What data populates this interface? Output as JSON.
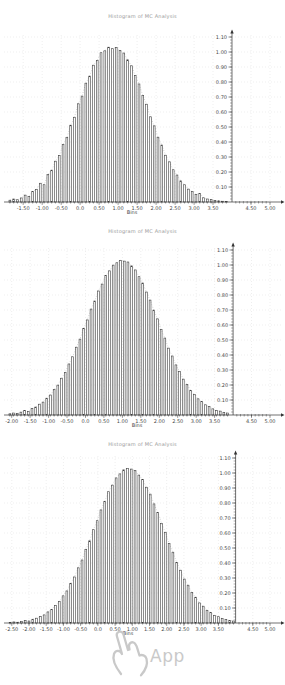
{
  "style": {
    "background_color": "#ffffff",
    "bar_color": "#3f3f3f",
    "axis_color": "#333333",
    "grid_color": "#dcdcdc",
    "envelope_color": "#b5b5b5",
    "label_color": "#4a4a4a",
    "title_color": "#9b9b9b",
    "watermark_color": "#c9c9c9"
  },
  "watermark": {
    "icon": "pointing-hand-icon",
    "label": "App"
  },
  "chart_data": [
    {
      "type": "bar",
      "title": "Histogram of MC Analysis",
      "xlabel": "Bins",
      "ylabel": "",
      "grid": "dotted",
      "xlim": [
        -1.9,
        5.0
      ],
      "ylim": [
        0,
        1.15
      ],
      "y_axis_x": 4.0,
      "bin_start": -1.85,
      "bin_step": 0.1,
      "values": [
        0.012,
        0.02,
        0.015,
        0.027,
        0.046,
        0.038,
        0.071,
        0.084,
        0.125,
        0.115,
        0.183,
        0.212,
        0.272,
        0.309,
        0.383,
        0.43,
        0.512,
        0.565,
        0.655,
        0.706,
        0.792,
        0.839,
        0.912,
        0.944,
        0.995,
        1.008,
        1.032,
        1.022,
        1.031,
        1.009,
        0.993,
        0.948,
        0.908,
        0.843,
        0.787,
        0.71,
        0.652,
        0.568,
        0.508,
        0.432,
        0.38,
        0.312,
        0.268,
        0.215,
        0.18,
        0.141,
        0.115,
        0.086,
        0.069,
        0.05,
        0.058,
        0.028,
        0.02,
        0.016,
        0.01,
        0.008,
        0.005,
        0.004
      ],
      "x_ticks": {
        "values": [
          -1.5,
          -1.0,
          -0.5,
          0,
          0.5,
          1.0,
          1.5,
          2.0,
          2.5,
          3.0,
          3.5,
          4.5,
          5.0
        ],
        "labels": [
          "-1.50",
          "-1.00",
          "-0.50",
          "0.0",
          "0.50",
          "1.00",
          "1.50",
          "2.00",
          "2.50",
          "3.00",
          "3.50",
          "4.50",
          "5.00"
        ]
      },
      "y_ticks": {
        "values": [
          0.1,
          0.2,
          0.3,
          0.4,
          0.5,
          0.6,
          0.7,
          0.8,
          0.9,
          1.0,
          1.1
        ],
        "labels": [
          "0.10",
          "0.20",
          "0.30",
          "0.40",
          "0.50",
          "0.60",
          "0.70",
          "0.80",
          "0.90",
          "1.00",
          "1.10"
        ]
      }
    },
    {
      "type": "bar",
      "title": "Histogram of MC Analysis",
      "xlabel": "Bins",
      "ylabel": "",
      "grid": "dotted",
      "xlim": [
        -2.1,
        5.0
      ],
      "ylim": [
        0,
        1.15
      ],
      "y_axis_x": 4.0,
      "bin_start": -2.05,
      "bin_step": 0.1,
      "values": [
        0.008,
        0.013,
        0.01,
        0.019,
        0.029,
        0.024,
        0.044,
        0.053,
        0.072,
        0.086,
        0.112,
        0.133,
        0.17,
        0.199,
        0.245,
        0.284,
        0.34,
        0.388,
        0.452,
        0.506,
        0.576,
        0.634,
        0.706,
        0.76,
        0.827,
        0.873,
        0.929,
        0.961,
        0.999,
        1.015,
        1.031,
        1.026,
        1.02,
        0.994,
        0.967,
        0.922,
        0.88,
        0.82,
        0.766,
        0.699,
        0.641,
        0.57,
        0.513,
        0.446,
        0.393,
        0.334,
        0.289,
        0.239,
        0.204,
        0.164,
        0.138,
        0.108,
        0.089,
        0.068,
        0.056,
        0.041,
        0.031,
        0.026,
        0.017,
        0.013
      ],
      "x_ticks": {
        "values": [
          -2.0,
          -1.5,
          -1.0,
          -0.5,
          0,
          0.5,
          1.0,
          1.5,
          2.0,
          2.5,
          3.0,
          3.5,
          4.5,
          5.0
        ],
        "labels": [
          "-2.00",
          "-1.50",
          "-1.00",
          "-0.50",
          "0.0",
          "0.50",
          "1.00",
          "1.50",
          "2.00",
          "2.50",
          "3.00",
          "3.50",
          "4.50",
          "5.00"
        ]
      },
      "y_ticks": {
        "values": [
          0.1,
          0.2,
          0.3,
          0.4,
          0.5,
          0.6,
          0.7,
          0.8,
          0.9,
          1.0,
          1.1
        ],
        "labels": [
          "0.10",
          "0.20",
          "0.30",
          "0.40",
          "0.50",
          "0.60",
          "0.70",
          "0.80",
          "0.90",
          "1.00",
          "1.10"
        ]
      }
    },
    {
      "type": "bar",
      "title": "Histogram of MC Analysis",
      "xlabel": "Bins",
      "ylabel": "",
      "grid": "dotted",
      "xlim": [
        -2.61,
        5.0
      ],
      "ylim": [
        0,
        1.15
      ],
      "y_axis_x": 4.0,
      "bin_start": -2.55,
      "bin_step": 0.11,
      "values": [
        0.004,
        0.007,
        0.005,
        0.009,
        0.016,
        0.013,
        0.025,
        0.032,
        0.044,
        0.054,
        0.074,
        0.09,
        0.118,
        0.143,
        0.181,
        0.214,
        0.264,
        0.307,
        0.368,
        0.42,
        0.489,
        0.548,
        0.622,
        0.682,
        0.754,
        0.81,
        0.875,
        0.919,
        0.967,
        0.994,
        1.021,
        1.03,
        1.026,
        1.016,
        0.986,
        0.957,
        0.905,
        0.859,
        0.794,
        0.737,
        0.664,
        0.603,
        0.531,
        0.472,
        0.404,
        0.352,
        0.293,
        0.252,
        0.203,
        0.172,
        0.134,
        0.112,
        0.085,
        0.07,
        0.051,
        0.042,
        0.029,
        0.024,
        0.016,
        0.013
      ],
      "x_ticks": {
        "values": [
          -2.5,
          -2.0,
          -1.5,
          -1.0,
          -0.5,
          0,
          0.5,
          1.0,
          1.5,
          2.0,
          2.5,
          3.0,
          3.5,
          4.5,
          5.0
        ],
        "labels": [
          "-2.50",
          "-2.00",
          "-1.50",
          "-1.00",
          "-0.50",
          "0.0",
          "0.50",
          "1.00",
          "1.50",
          "2.00",
          "2.50",
          "3.00",
          "3.50",
          "4.50",
          "5.00"
        ]
      },
      "y_ticks": {
        "values": [
          0.1,
          0.2,
          0.3,
          0.4,
          0.5,
          0.6,
          0.7,
          0.8,
          0.9,
          1.0,
          1.1
        ],
        "labels": [
          "0.10",
          "0.20",
          "0.30",
          "0.40",
          "0.50",
          "0.60",
          "0.70",
          "0.80",
          "0.90",
          "1.00",
          "1.10"
        ]
      }
    }
  ]
}
